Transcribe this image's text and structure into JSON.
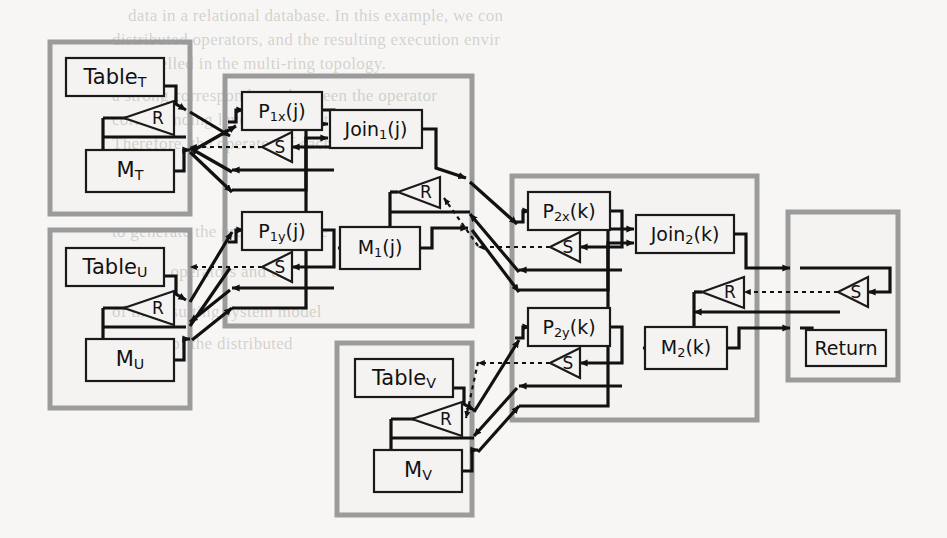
{
  "figure": {
    "colors": {
      "panel_stroke": "#9b9b9b",
      "box_stroke": "#1a1a1a",
      "wire": "#111111",
      "background": "#f7f6f4"
    },
    "icons": {
      "receive": "R",
      "send": "S"
    }
  },
  "ghost_text": [
    {
      "text": "data in a relational database. In this example, we con",
      "x": 128,
      "y": 16
    },
    {
      "text": "distributed operators, and the resulting execution envir",
      "x": 112,
      "y": 40
    },
    {
      "text": "is modelled in the multi-ring topology.",
      "x": 112,
      "y": 64
    },
    {
      "text": "a strong correspondence between the operator",
      "x": 112,
      "y": 96
    },
    {
      "text": "corresponding level-manipulating machine",
      "x": 112,
      "y": 120
    },
    {
      "text": "Therefore, the operator of each node",
      "x": 112,
      "y": 144
    },
    {
      "text": "to generate the processing tree",
      "x": 112,
      "y": 232
    },
    {
      "text": "the join operators and the",
      "x": 112,
      "y": 272
    },
    {
      "text": "of the resulting system model",
      "x": 112,
      "y": 312
    },
    {
      "text": "per unit of the distributed",
      "x": 112,
      "y": 344
    }
  ],
  "panels": [
    {
      "id": "panel-table-t",
      "name": "table-t-panel",
      "x": 50,
      "y": 42,
      "w": 140,
      "h": 172
    },
    {
      "id": "panel-table-u",
      "name": "table-u-panel",
      "x": 50,
      "y": 230,
      "w": 140,
      "h": 178
    },
    {
      "id": "panel-stage-1",
      "name": "stage-1-panel",
      "x": 225,
      "y": 76,
      "w": 247,
      "h": 250
    },
    {
      "id": "panel-table-v",
      "name": "table-v-panel",
      "x": 337,
      "y": 343,
      "w": 135,
      "h": 172
    },
    {
      "id": "panel-stage-2",
      "name": "stage-2-panel",
      "x": 512,
      "y": 176,
      "w": 245,
      "h": 244
    },
    {
      "id": "panel-return",
      "name": "return-panel",
      "x": 788,
      "y": 212,
      "w": 110,
      "h": 168
    }
  ],
  "nodes": {
    "table_t": {
      "label": "Table",
      "sub": "T",
      "x": 66,
      "y": 58,
      "w": 98,
      "h": 38
    },
    "m_t": {
      "label": "M",
      "sub": "T",
      "x": 86,
      "y": 150,
      "w": 88,
      "h": 42
    },
    "r_t": {
      "label": "R"
    },
    "table_u": {
      "label": "Table",
      "sub": "U",
      "x": 66,
      "y": 248,
      "w": 98,
      "h": 38
    },
    "m_u": {
      "label": "M",
      "sub": "U",
      "x": 86,
      "y": 339,
      "w": 88,
      "h": 42
    },
    "r_u": {
      "label": "R"
    },
    "table_v": {
      "label": "Table",
      "sub": "V",
      "x": 355,
      "y": 359,
      "w": 98,
      "h": 38
    },
    "m_v": {
      "label": "M",
      "sub": "V",
      "x": 374,
      "y": 450,
      "w": 88,
      "h": 42
    },
    "r_v": {
      "label": "R"
    },
    "p1x": {
      "label": "P",
      "sub": "1x",
      "tail": "(j)",
      "x": 242,
      "y": 92,
      "w": 80,
      "h": 38
    },
    "s_p1x": {
      "label": "S"
    },
    "p1y": {
      "label": "P",
      "sub": "1y",
      "tail": "(j)",
      "x": 242,
      "y": 212,
      "w": 80,
      "h": 38
    },
    "s_p1y": {
      "label": "S"
    },
    "join1": {
      "label": "Join",
      "sub": "1",
      "tail": "(j)",
      "x": 330,
      "y": 110,
      "w": 92,
      "h": 38
    },
    "m1": {
      "label": "M",
      "sub": "1",
      "tail": "(j)",
      "x": 340,
      "y": 227,
      "w": 80,
      "h": 42
    },
    "r_1": {
      "label": "R"
    },
    "p2x": {
      "label": "P",
      "sub": "2x",
      "tail": "(k)",
      "x": 528,
      "y": 192,
      "w": 82,
      "h": 38
    },
    "s_p2x": {
      "label": "S"
    },
    "p2y": {
      "label": "P",
      "sub": "2y",
      "tail": "(k)",
      "x": 528,
      "y": 308,
      "w": 82,
      "h": 38
    },
    "s_p2y": {
      "label": "S"
    },
    "join2": {
      "label": "Join",
      "sub": "2",
      "tail": "(k)",
      "x": 636,
      "y": 215,
      "w": 98,
      "h": 38
    },
    "m2": {
      "label": "M",
      "sub": "2",
      "tail": "(k)",
      "x": 645,
      "y": 327,
      "w": 82,
      "h": 42
    },
    "r_2": {
      "label": "R"
    },
    "return": {
      "label": "Return",
      "x": 806,
      "y": 330,
      "w": 80,
      "h": 36
    },
    "s_ret": {
      "label": "S"
    }
  },
  "legend": {
    "r_meaning": "Receive unit",
    "s_meaning": "Send unit"
  }
}
